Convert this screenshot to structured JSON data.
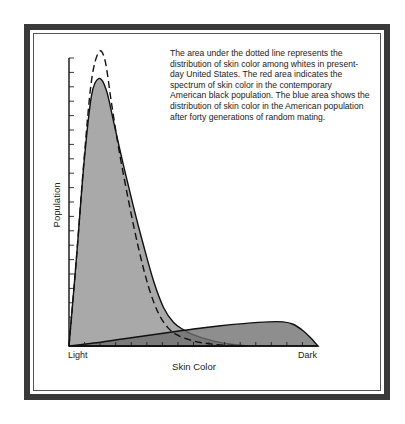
{
  "chart_data": {
    "type": "area",
    "title": "",
    "xlabel": "Skin Color",
    "ylabel": "Population",
    "x_endpoint_labels": [
      "Light",
      "Dark"
    ],
    "xlim": [
      0,
      1
    ],
    "ylim": [
      0,
      1
    ],
    "grid": false,
    "annotation": "The area under the dotted line represents the distribution of skin color among whites in present-day United States.  The red area indicates the spectrum of skin color in the contemporary American black population. The blue area shows the distribution of skin color in the American population after forty generations of random mating.",
    "y_tick_count": 20,
    "x_tick_count": 16,
    "series": [
      {
        "name": "Whites (present-day United States)",
        "style": "dashed-outline",
        "x": [
          0.0,
          0.03,
          0.06,
          0.09,
          0.12,
          0.145,
          0.17,
          0.2,
          0.24,
          0.28,
          0.32,
          0.36,
          0.4,
          0.44,
          0.5,
          0.56,
          0.62,
          0.7
        ],
        "y": [
          0.0,
          0.3,
          0.63,
          0.9,
          1.0,
          0.97,
          0.83,
          0.67,
          0.49,
          0.33,
          0.2,
          0.11,
          0.06,
          0.035,
          0.017,
          0.008,
          0.003,
          0.0
        ]
      },
      {
        "name": "American population after forty generations of random mating (blue area)",
        "style": "filled-light",
        "color": "#a9a9a9",
        "x": [
          0.0,
          0.03,
          0.06,
          0.09,
          0.12,
          0.15,
          0.18,
          0.22,
          0.26,
          0.3,
          0.34,
          0.38,
          0.42,
          0.46,
          0.5,
          0.55,
          0.6,
          0.66,
          0.72
        ],
        "y": [
          0.0,
          0.3,
          0.62,
          0.85,
          0.91,
          0.87,
          0.76,
          0.61,
          0.47,
          0.34,
          0.22,
          0.13,
          0.08,
          0.055,
          0.038,
          0.024,
          0.013,
          0.005,
          0.0
        ]
      },
      {
        "name": "Contemporary American black population (red area)",
        "style": "filled-dark",
        "color": "#6e6e6e",
        "x": [
          0.0,
          0.1,
          0.2,
          0.3,
          0.4,
          0.5,
          0.6,
          0.7,
          0.8,
          0.86,
          0.9,
          0.94,
          0.97,
          1.0
        ],
        "y": [
          0.0,
          0.01,
          0.022,
          0.034,
          0.046,
          0.058,
          0.068,
          0.076,
          0.082,
          0.082,
          0.074,
          0.052,
          0.028,
          0.0
        ]
      }
    ]
  }
}
